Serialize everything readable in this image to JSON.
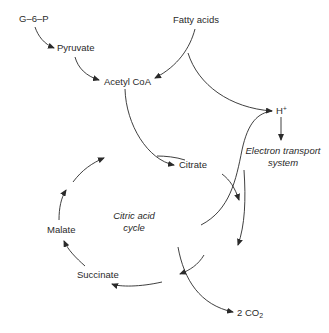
{
  "diagram": {
    "type": "metabolic-pathway",
    "nodes": {
      "g6p": "G–6–P",
      "pyruvate": "Pyruvate",
      "fatty_acids": "Fatty acids",
      "acetyl_coa": "Acetyl CoA",
      "h_plus": "H",
      "h_plus_sup": "+",
      "ets_line1": "Electron transport",
      "ets_line2": "system",
      "citrate": "Citrate",
      "cycle_line1": "Citric acid",
      "cycle_line2": "cycle",
      "malate": "Malate",
      "succinate": "Succinate",
      "co2": "2 CO",
      "co2_sub": "2"
    },
    "edges": [
      {
        "from": "G-6-P",
        "to": "Pyruvate"
      },
      {
        "from": "Pyruvate",
        "to": "Acetyl CoA"
      },
      {
        "from": "Fatty acids",
        "to": "Acetyl CoA"
      },
      {
        "from": "Fatty acids",
        "to": "H+"
      },
      {
        "from": "Acetyl CoA",
        "to": "Citrate"
      },
      {
        "from": "Citrate",
        "to": "cycle (downward)"
      },
      {
        "from": "cycle",
        "to": "H+"
      },
      {
        "from": "H+",
        "to": "Electron transport system"
      },
      {
        "from": "cycle",
        "to": "Succinate"
      },
      {
        "from": "cycle",
        "to": "2 CO2"
      },
      {
        "from": "Succinate",
        "to": "Malate"
      },
      {
        "from": "Malate",
        "to": "cycle (upward)"
      }
    ],
    "colors": {
      "line": "#2a2a2a",
      "text": "#2a2a2a",
      "background": "#ffffff"
    }
  }
}
